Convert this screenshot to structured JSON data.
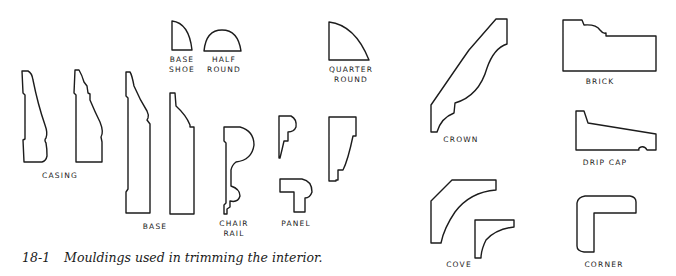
{
  "figure": {
    "number": "18-1",
    "caption": "Mouldings used in trimming the interior."
  },
  "mouldings": [
    {
      "id": "casing",
      "label": "CASING",
      "profiles": 2
    },
    {
      "id": "base-shoe",
      "label": "BASE\nSHOE",
      "profiles": 1
    },
    {
      "id": "half-round",
      "label": "HALF\nROUND",
      "profiles": 1
    },
    {
      "id": "quarter-round",
      "label": "QUARTER\nROUND",
      "profiles": 1
    },
    {
      "id": "base",
      "label": "BASE",
      "profiles": 2
    },
    {
      "id": "chair-rail",
      "label": "CHAIR\nRAIL",
      "profiles": 1
    },
    {
      "id": "panel",
      "label": "PANEL",
      "profiles": 3
    },
    {
      "id": "crown",
      "label": "CROWN",
      "profiles": 1
    },
    {
      "id": "cove",
      "label": "COVE",
      "profiles": 2
    },
    {
      "id": "brick",
      "label": "BRICK",
      "profiles": 1
    },
    {
      "id": "drip-cap",
      "label": "DRIP CAP",
      "profiles": 1
    },
    {
      "id": "corner",
      "label": "CORNER",
      "profiles": 1
    }
  ],
  "colors": {
    "line": "#1c1c1c",
    "background": "#ffffff"
  }
}
